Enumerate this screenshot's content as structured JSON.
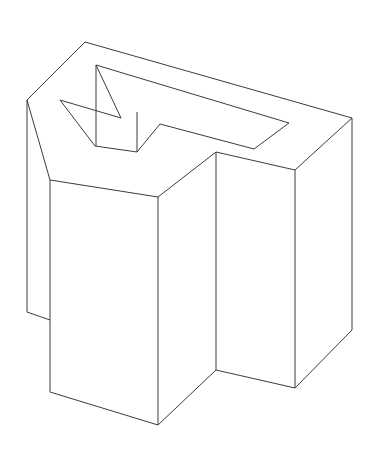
{
  "figure": {
    "kind": "technical-line-drawing",
    "projection": "isometric",
    "canvas": {
      "width": 377,
      "height": 450,
      "background": "#ffffff"
    },
    "style": {
      "stroke_color": "#3c3c3c",
      "stroke_width": 1,
      "fill_color": "#ffffff",
      "shading": "none"
    },
    "faces": [
      {
        "name": "top-face",
        "label": "Top surface with T-shaped cut-out",
        "outer_points": "85,42 352,118 295,170 216,152 158,197 50,180 27,100",
        "hole_points": "96,65 289,123 254,149 160,124 137,152 95,146 121,118 60,100"
      },
      {
        "name": "back-slab-left-face",
        "label": "Left end face of rear slab",
        "points": "27,100 50,180 50,320 27,312"
      },
      {
        "name": "front-left-column-left-face",
        "label": "Left face of front-left column",
        "points": "50,180 158,197 158,425 50,392"
      },
      {
        "name": "front-left-column-right-face",
        "label": "Right face of front-left column",
        "points": "158,197 216,152 216,370 158,425"
      },
      {
        "name": "right-column-front-face",
        "label": "Front face of right column",
        "points": "216,152 295,170 295,388 216,370"
      },
      {
        "name": "right-slab-side-face",
        "label": "Right side face of rear slab",
        "points": "295,170 352,118 352,330 295,388"
      }
    ],
    "edges": [
      {
        "name": "top-outline",
        "points": "85,42 352,118 295,170 216,152 158,197 50,180 27,100 85,42"
      },
      {
        "name": "hole-outline",
        "points": "60,100 121,118 96,65 289,123 254,149 160,124 137,152 95,146 60,100"
      },
      {
        "name": "hole-notch-vertical",
        "points": "96,65 96,146"
      },
      {
        "name": "hole-notch-vertical-2",
        "points": "137,152 137,112"
      },
      {
        "name": "left-slab-vertical",
        "points": "27,100 27,312"
      },
      {
        "name": "left-slab-bottom",
        "points": "27,312 50,320"
      },
      {
        "name": "left-slab-inner-vertical",
        "points": "50,180 50,392"
      },
      {
        "name": "front-column-left-vertical",
        "points": "50,180 50,392"
      },
      {
        "name": "front-column-bottom-left",
        "points": "50,392 158,425"
      },
      {
        "name": "front-column-center-vertical",
        "points": "158,197 158,425"
      },
      {
        "name": "front-column-bottom-right",
        "points": "158,425 216,370"
      },
      {
        "name": "right-column-left-vertical",
        "points": "216,152 216,370"
      },
      {
        "name": "right-column-right-vertical",
        "points": "295,170 295,388"
      },
      {
        "name": "right-column-bottom",
        "points": "216,370 295,388"
      },
      {
        "name": "right-slab-vertical",
        "points": "352,118 352,330"
      },
      {
        "name": "right-slab-bottom",
        "points": "295,388 352,330"
      }
    ],
    "vertices": {
      "top_back_apex": [
        85,
        42
      ],
      "top_right_corner": [
        352,
        118
      ],
      "top_left_corner": [
        27,
        100
      ],
      "top_mid_notch": [
        216,
        152
      ],
      "top_front_notch": [
        158,
        197
      ],
      "top_front_left": [
        50,
        180
      ],
      "right_inner_top": [
        295,
        170
      ],
      "bottom_front_apex": [
        158,
        425
      ],
      "bottom_right": [
        295,
        388
      ],
      "bottom_far_right": [
        352,
        330
      ],
      "bottom_left": [
        50,
        392
      ],
      "back_slab_bottom_left": [
        27,
        312
      ]
    }
  }
}
